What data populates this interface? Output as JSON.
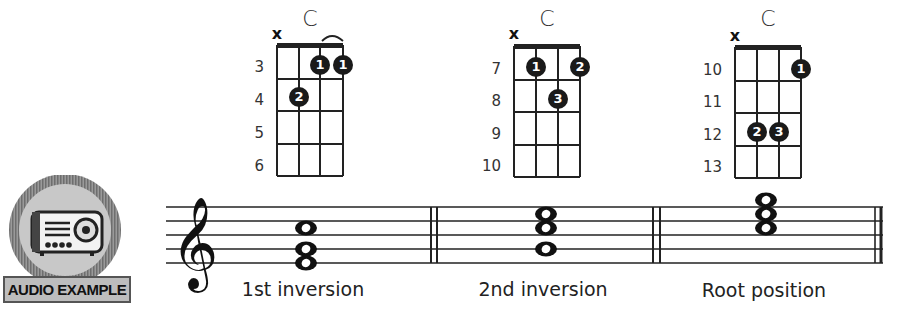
{
  "badge": {
    "label": "AUDIO EXAMPLE",
    "icon": "radio-icon"
  },
  "chord_diagrams": [
    {
      "name": "C",
      "muted_string": "x",
      "fret_numbers": [
        "3",
        "4",
        "5",
        "6"
      ],
      "fingers": [
        {
          "string": 3,
          "fret": 1,
          "label": "1"
        },
        {
          "string": 4,
          "fret": 1,
          "label": "1"
        },
        {
          "string": 2,
          "fret": 2,
          "label": "2"
        }
      ],
      "barre": true
    },
    {
      "name": "C",
      "muted_string": "x",
      "fret_numbers": [
        "7",
        "8",
        "9",
        "10"
      ],
      "fingers": [
        {
          "string": 2,
          "fret": 1,
          "label": "1"
        },
        {
          "string": 4,
          "fret": 1,
          "label": "2"
        },
        {
          "string": 3,
          "fret": 2,
          "label": "3"
        }
      ],
      "barre": false
    },
    {
      "name": "C",
      "muted_string": "x",
      "fret_numbers": [
        "10",
        "11",
        "12",
        "13"
      ],
      "fingers": [
        {
          "string": 4,
          "fret": 1,
          "label": "1"
        },
        {
          "string": 2,
          "fret": 3,
          "label": "2"
        },
        {
          "string": 3,
          "fret": 3,
          "label": "3"
        }
      ],
      "barre": false
    }
  ],
  "staff": {
    "clef": "treble",
    "measures": [
      {
        "label": "1st inversion",
        "notes": [
          "E4",
          "G4",
          "C5"
        ]
      },
      {
        "label": "2nd inversion",
        "notes": [
          "G4",
          "C5",
          "E5"
        ]
      },
      {
        "label": "Root position",
        "notes": [
          "C5",
          "E5",
          "G5"
        ]
      }
    ]
  }
}
